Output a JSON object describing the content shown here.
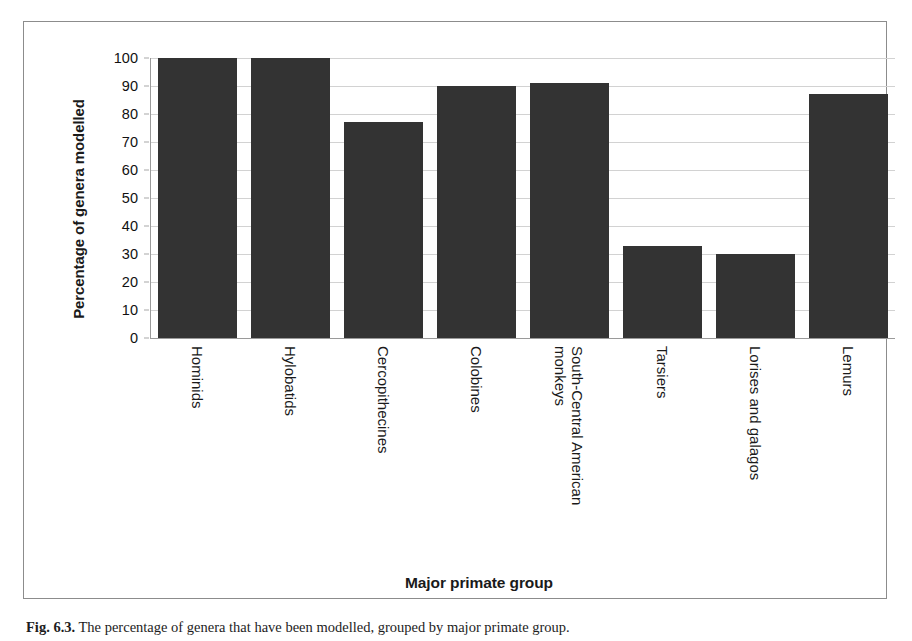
{
  "figure": {
    "caption_label": "Fig. 6.3.",
    "caption_text": "The percentage of genera that have been modelled, grouped by major primate group."
  },
  "chart_data": {
    "type": "bar",
    "title": "",
    "xlabel": "Major primate group",
    "ylabel": "Percentage of genera modelled",
    "ylim": [
      0,
      100
    ],
    "ytick_step": 10,
    "yticks": [
      100,
      90,
      80,
      70,
      60,
      50,
      40,
      30,
      20,
      10,
      0
    ],
    "grid": true,
    "legend": "none",
    "bar_color": "#333333",
    "gridline_color": "#d2d2d2",
    "axis_color": "#9a9a9a",
    "categories": [
      "Hominids",
      "Hylobatids",
      "Cercopithecines",
      "Colobines",
      "South-Central American monkeys",
      "Tarsiers",
      "Lorises and galagos",
      "Lemurs"
    ],
    "category_lines": [
      [
        "Hominids"
      ],
      [
        "Hylobatids"
      ],
      [
        "Cercopithecines"
      ],
      [
        "Colobines"
      ],
      [
        "South-Central American",
        "monkeys"
      ],
      [
        "Tarsiers"
      ],
      [
        "Lorises and galagos"
      ],
      [
        "Lemurs"
      ]
    ],
    "values": [
      100,
      100,
      77,
      90,
      91,
      33,
      30,
      87
    ]
  }
}
